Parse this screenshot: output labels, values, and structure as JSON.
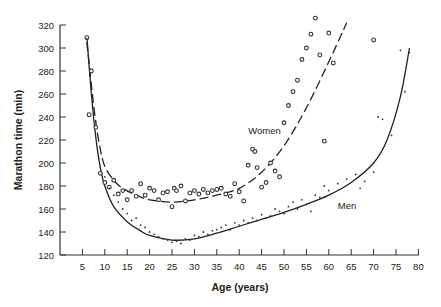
{
  "chart_data": {
    "type": "scatter",
    "title": "",
    "xlabel": "Age (years)",
    "ylabel": "Marathon time (min)",
    "xlim": [
      0,
      80
    ],
    "ylim": [
      120,
      320
    ],
    "xticks": [
      5,
      10,
      15,
      20,
      25,
      30,
      35,
      40,
      45,
      50,
      55,
      60,
      65,
      70,
      75,
      80
    ],
    "yticks": [
      120,
      140,
      160,
      180,
      200,
      220,
      240,
      260,
      280,
      300,
      320
    ],
    "grid": false,
    "legend": "none (inline annotations)",
    "annotations": [
      {
        "text": "Women",
        "x": 42,
        "y": 225
      },
      {
        "text": "Men",
        "x": 62,
        "y": 160
      }
    ],
    "series": [
      {
        "name": "Women",
        "marker": "open circle",
        "points": [
          [
            6,
            309
          ],
          [
            7,
            280
          ],
          [
            6.5,
            242
          ],
          [
            8,
            231
          ],
          [
            9,
            191
          ],
          [
            10,
            183
          ],
          [
            11,
            179
          ],
          [
            12,
            185
          ],
          [
            13,
            173
          ],
          [
            14,
            176
          ],
          [
            15,
            168
          ],
          [
            16,
            176
          ],
          [
            17,
            171
          ],
          [
            18,
            182
          ],
          [
            19,
            172
          ],
          [
            20,
            178
          ],
          [
            21,
            176
          ],
          [
            22,
            168
          ],
          [
            23,
            174
          ],
          [
            24,
            175
          ],
          [
            25,
            162
          ],
          [
            25.5,
            178
          ],
          [
            26,
            176
          ],
          [
            27,
            180
          ],
          [
            28,
            167
          ],
          [
            29,
            174
          ],
          [
            30,
            176
          ],
          [
            31,
            173
          ],
          [
            32,
            177
          ],
          [
            33,
            174
          ],
          [
            34,
            176
          ],
          [
            35,
            177
          ],
          [
            36,
            178
          ],
          [
            37,
            173
          ],
          [
            38,
            171
          ],
          [
            39,
            182
          ],
          [
            40,
            175
          ],
          [
            41,
            167
          ],
          [
            42,
            198
          ],
          [
            43,
            212
          ],
          [
            43.5,
            210
          ],
          [
            44,
            196
          ],
          [
            45,
            179
          ],
          [
            46,
            183
          ],
          [
            47,
            200
          ],
          [
            48,
            193
          ],
          [
            49,
            188
          ],
          [
            50,
            235
          ],
          [
            51,
            250
          ],
          [
            52,
            262
          ],
          [
            53,
            272
          ],
          [
            54,
            290
          ],
          [
            55,
            300
          ],
          [
            56,
            312
          ],
          [
            57,
            326
          ],
          [
            58,
            294
          ],
          [
            59,
            219
          ],
          [
            60,
            313
          ],
          [
            61,
            287
          ],
          [
            70,
            307
          ]
        ]
      },
      {
        "name": "Men",
        "marker": "dot",
        "points": [
          [
            6,
            308
          ],
          [
            8,
            236
          ],
          [
            9,
            196
          ],
          [
            10,
            188
          ],
          [
            11,
            178
          ],
          [
            12,
            172
          ],
          [
            13,
            166
          ],
          [
            14,
            160
          ],
          [
            15,
            156
          ],
          [
            16,
            150
          ],
          [
            17,
            152
          ],
          [
            18,
            146
          ],
          [
            19,
            144
          ],
          [
            20,
            140
          ],
          [
            21,
            138
          ],
          [
            22,
            136
          ],
          [
            23,
            134
          ],
          [
            24,
            133
          ],
          [
            25,
            131
          ],
          [
            26,
            132
          ],
          [
            27,
            130
          ],
          [
            28,
            134
          ],
          [
            29,
            133
          ],
          [
            30,
            137
          ],
          [
            31,
            136
          ],
          [
            32,
            140
          ],
          [
            33,
            138
          ],
          [
            34,
            141
          ],
          [
            35,
            142
          ],
          [
            36,
            144
          ],
          [
            37,
            146
          ],
          [
            38,
            142
          ],
          [
            39,
            148
          ],
          [
            40,
            146
          ],
          [
            41,
            150
          ],
          [
            42,
            148
          ],
          [
            43,
            152
          ],
          [
            44,
            150
          ],
          [
            45,
            155
          ],
          [
            46,
            152
          ],
          [
            47,
            154
          ],
          [
            48,
            160
          ],
          [
            49,
            158
          ],
          [
            50,
            156
          ],
          [
            51,
            162
          ],
          [
            52,
            166
          ],
          [
            53,
            160
          ],
          [
            54,
            168
          ],
          [
            55,
            164
          ],
          [
            56,
            158
          ],
          [
            57,
            172
          ],
          [
            58,
            170
          ],
          [
            59,
            180
          ],
          [
            60,
            176
          ],
          [
            62,
            182
          ],
          [
            64,
            186
          ],
          [
            66,
            190
          ],
          [
            67,
            178
          ],
          [
            68,
            184
          ],
          [
            70,
            192
          ],
          [
            71,
            240
          ],
          [
            72,
            238
          ],
          [
            74,
            224
          ],
          [
            76,
            298
          ],
          [
            77,
            262
          ],
          [
            78,
            296
          ]
        ]
      }
    ],
    "fit_curves": [
      {
        "name": "Women fit (dashed)",
        "points": [
          [
            6,
            305
          ],
          [
            7,
            268
          ],
          [
            8,
            235
          ],
          [
            9,
            212
          ],
          [
            10,
            197
          ],
          [
            12,
            185
          ],
          [
            14,
            178
          ],
          [
            17,
            172
          ],
          [
            20,
            168
          ],
          [
            25,
            166
          ],
          [
            30,
            168
          ],
          [
            35,
            172
          ],
          [
            40,
            178
          ],
          [
            45,
            192
          ],
          [
            50,
            215
          ],
          [
            55,
            248
          ],
          [
            60,
            288
          ],
          [
            64,
            322
          ]
        ]
      },
      {
        "name": "Men fit (solid)",
        "points": [
          [
            6,
            310
          ],
          [
            7,
            260
          ],
          [
            8,
            222
          ],
          [
            9,
            196
          ],
          [
            10,
            180
          ],
          [
            12,
            162
          ],
          [
            15,
            149
          ],
          [
            18,
            141
          ],
          [
            20,
            137
          ],
          [
            25,
            133
          ],
          [
            30,
            134
          ],
          [
            35,
            139
          ],
          [
            40,
            145
          ],
          [
            45,
            151
          ],
          [
            50,
            157
          ],
          [
            55,
            164
          ],
          [
            60,
            172
          ],
          [
            65,
            183
          ],
          [
            70,
            200
          ],
          [
            73,
            220
          ],
          [
            76,
            258
          ],
          [
            78,
            300
          ]
        ]
      }
    ]
  }
}
